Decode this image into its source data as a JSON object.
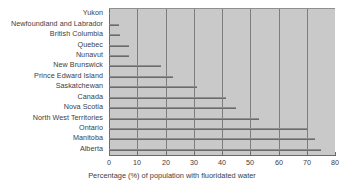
{
  "chart_data": {
    "type": "bar",
    "orientation": "horizontal",
    "title": "",
    "xlabel": "Percentage (%) of population with fluoridated water",
    "ylabel": "",
    "xlim": [
      0,
      80
    ],
    "ylim": null,
    "xticks": [
      0,
      10,
      20,
      30,
      40,
      50,
      60,
      70,
      80
    ],
    "grid": "vertical",
    "legend": "none",
    "categories": [
      "Yukon",
      "Newfoundland and Labrador",
      "British Columbia",
      "Quebec",
      "Nunavut",
      "New Brunswick",
      "Prince Edward Island",
      "Saskatchewan",
      "Canada",
      "Nova Scotia",
      "North West Territories",
      "Ontario",
      "Manitoba",
      "Alberta"
    ],
    "values": [
      0,
      3.5,
      4,
      7,
      7,
      18.5,
      22.5,
      31,
      41.5,
      45,
      53,
      70,
      73,
      75
    ],
    "colors": {
      "figure_background": "#ffffff",
      "plot_background": "#c9c9c9",
      "gridline": "#7d7d7d",
      "bar": "#6b6b6b",
      "text": "#3d3d3d",
      "axis": "#6b6b6b"
    }
  }
}
